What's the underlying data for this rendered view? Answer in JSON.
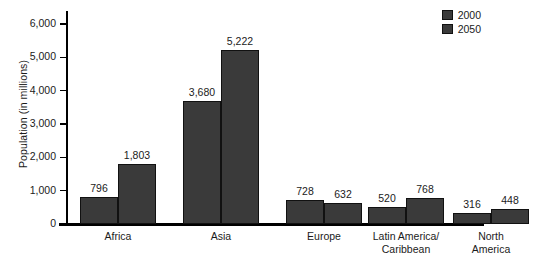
{
  "chart_data": {
    "type": "bar",
    "title": "",
    "subtitle": "",
    "xlabel": "",
    "ylabel": "Population (in millions)",
    "ylim": [
      0,
      6000
    ],
    "ytick_step": 1000,
    "grid": false,
    "legend_position": "top-right",
    "categories": [
      "Africa",
      "Asia",
      "Europe",
      "Latin America/\nCaribbean",
      "North\nAmerica"
    ],
    "category_lines": [
      [
        "Africa"
      ],
      [
        "Asia"
      ],
      [
        "Europe"
      ],
      [
        "Latin America/",
        "Caribbean"
      ],
      [
        "North",
        "America"
      ]
    ],
    "ytick_labels": [
      "0",
      "1,000",
      "2,000",
      "3,000",
      "4,000",
      "5,000",
      "6,000"
    ],
    "ytick_values": [
      0,
      1000,
      2000,
      3000,
      4000,
      5000,
      6000
    ],
    "series": [
      {
        "name": "2000",
        "color": "#3a3a3a",
        "values": [
          796,
          3680,
          728,
          520,
          316
        ],
        "labels": [
          "796",
          "3,680",
          "728",
          "520",
          "316"
        ]
      },
      {
        "name": "2050",
        "color": "#3a3a3a",
        "values": [
          1803,
          5222,
          632,
          768,
          448
        ],
        "labels": [
          "1,803",
          "5,222",
          "632",
          "768",
          "448"
        ]
      }
    ]
  },
  "legend": {
    "items": [
      {
        "label": "2000",
        "color": "#3a3a3a"
      },
      {
        "label": "2050",
        "color": "#3a3a3a"
      }
    ]
  },
  "colors": {
    "bar_fill": "#3a3a3a",
    "bar_stroke": "#111111",
    "axis": "#000000",
    "text": "#1b1b1b",
    "background": "#ffffff"
  }
}
